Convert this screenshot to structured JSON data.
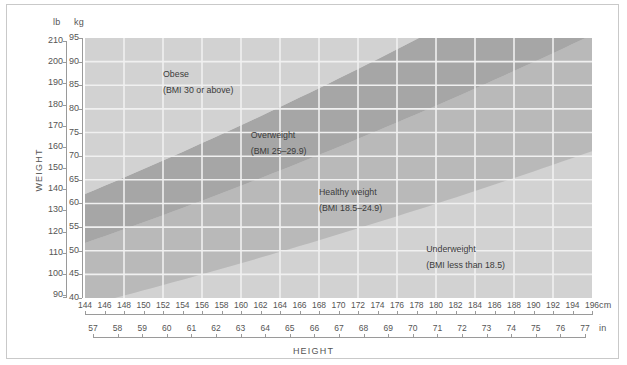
{
  "chart_data": {
    "type": "area",
    "title": "",
    "subtitle": "",
    "xlabel": "HEIGHT",
    "ylabel": "WEIGHT",
    "grid": true,
    "legend_position": "in-plot annotations",
    "axes": {
      "x_primary": {
        "unit": "cm",
        "unit_label": "cm",
        "range": [
          144,
          196
        ],
        "ticks": [
          144,
          146,
          148,
          150,
          152,
          154,
          156,
          158,
          160,
          162,
          164,
          166,
          168,
          170,
          172,
          174,
          176,
          178,
          180,
          182,
          184,
          186,
          188,
          190,
          192,
          194,
          196
        ]
      },
      "x_secondary": {
        "unit": "in",
        "unit_label": "in",
        "range": [
          57,
          77
        ],
        "ticks": [
          57,
          58,
          59,
          60,
          61,
          62,
          63,
          64,
          65,
          66,
          67,
          68,
          69,
          70,
          71,
          72,
          73,
          74,
          75,
          76,
          77
        ]
      },
      "y_primary": {
        "unit": "lb",
        "unit_label": "lb",
        "range": [
          90,
          210
        ],
        "ticks": [
          210,
          200,
          190,
          180,
          170,
          160,
          150,
          140,
          130,
          120,
          110,
          100,
          90
        ]
      },
      "y_secondary": {
        "unit": "kg",
        "unit_label": "kg",
        "range": [
          40,
          95
        ],
        "ticks": [
          95,
          90,
          85,
          80,
          75,
          70,
          65,
          60,
          55,
          50,
          45,
          40
        ]
      }
    },
    "bands": [
      {
        "name": "Obese",
        "label": "Obese",
        "sublabel": "(BMI 30 or above)",
        "bmi_min": 30,
        "bmi_max": null,
        "color": "#d2d2d2",
        "label_x_cm": 152,
        "label_y_kg": 87
      },
      {
        "name": "Overweight",
        "label": "Overweight",
        "sublabel": "(BMI 25–29.9)",
        "bmi_min": 25,
        "bmi_max": 29.9,
        "color": "#a6a6a6",
        "label_x_cm": 161,
        "label_y_kg": 74
      },
      {
        "name": "Healthy weight",
        "label": "Healthy weight",
        "sublabel": "(BMI 18.5–24.9)",
        "bmi_min": 18.5,
        "bmi_max": 24.9,
        "color": "#b9b9b9",
        "label_x_cm": 168,
        "label_y_kg": 62
      },
      {
        "name": "Underweight",
        "label": "Underweight",
        "sublabel": "(BMI less than 18.5)",
        "bmi_min": null,
        "bmi_max": 18.5,
        "color": "#d2d2d2",
        "label_x_cm": 179,
        "label_y_kg": 50
      }
    ],
    "gridline_color": "#f0f0f0",
    "boundary_curves": [
      {
        "bmi": 30,
        "description": "Obese / Overweight boundary"
      },
      {
        "bmi": 25,
        "description": "Overweight / Healthy weight boundary"
      },
      {
        "bmi": 18.5,
        "description": "Healthy weight / Underweight boundary"
      }
    ]
  }
}
